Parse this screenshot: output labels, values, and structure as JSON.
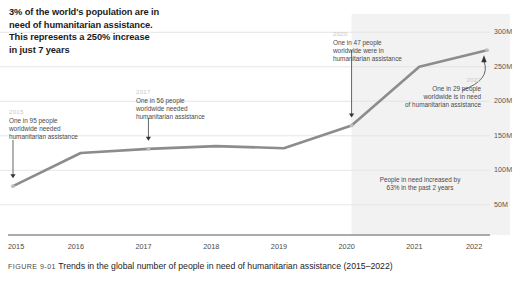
{
  "headline": {
    "lines": [
      "3% of the world's population are in",
      "need of humanitarian assistance.",
      "This represents a 250% increase",
      "in just 7 years"
    ]
  },
  "annotations": [
    {
      "key": "a2015",
      "year": "2015",
      "lines": [
        "One in 95 people",
        "worldwide needed",
        "humanitarian assistance"
      ]
    },
    {
      "key": "a2017",
      "year": "2017",
      "lines": [
        "One in 56 people",
        "worldwide needed",
        "humanitarian assistance"
      ]
    },
    {
      "key": "a2020",
      "year": "2020",
      "lines": [
        "One in 47 people",
        "worldwide were in",
        "humanitarian assistance"
      ]
    },
    {
      "key": "a2022",
      "year": "2022",
      "lines": [
        "One in 29 people",
        "worldwide is in need",
        "of humanitarian assistance"
      ]
    }
  ],
  "callout": {
    "lines": [
      "People in need increased by",
      "63% in the past 2 years"
    ]
  },
  "caption": {
    "number": "FIGURE 9-01",
    "text": "Trends in the global number of people in need of humanitarian assistance (2015–2022)"
  },
  "colors": {
    "line": "#8c8c8c",
    "grid": "#e3e3e3",
    "axis": "#8f8f8f",
    "shade": "#f2f2f2",
    "year_label": "#c9c9c9",
    "text": "#3a3a3a"
  },
  "chart_data": {
    "type": "line",
    "title": "Trends in the global number of people in need of humanitarian assistance (2015–2022)",
    "xlabel": "",
    "ylabel": "",
    "categories": [
      "2015",
      "2016",
      "2017",
      "2018",
      "2019",
      "2020",
      "2021",
      "2022"
    ],
    "x": [
      2015,
      2016,
      2017,
      2018,
      2019,
      2020,
      2021,
      2022
    ],
    "values": [
      77000000,
      125000000,
      131000000,
      135000000,
      132000000,
      165000000,
      250000000,
      274000000
    ],
    "value_labels": [
      "77M",
      "125M",
      "131M",
      "135M",
      "132M",
      "165M",
      "250M",
      "274M"
    ],
    "ylim": [
      25000000,
      312000000
    ],
    "yticks": [
      50000000,
      100000000,
      150000000,
      200000000,
      250000000,
      300000000
    ],
    "ytick_labels": [
      "50M",
      "100M",
      "150M",
      "200M",
      "250M",
      "300M"
    ],
    "xtick_labels": [
      "2015",
      "2016",
      "2017",
      "2018",
      "2019",
      "2020",
      "2021",
      "2022"
    ],
    "grid": true,
    "legend": "none",
    "series": [
      {
        "name": "People in need of humanitarian assistance",
        "values": [
          77000000,
          125000000,
          131000000,
          135000000,
          132000000,
          165000000,
          250000000,
          274000000
        ]
      }
    ],
    "shaded_region": {
      "from": "2020",
      "to": "2022",
      "label": ""
    },
    "markers": [
      {
        "year": "2015",
        "ratio": "One in 95 people"
      },
      {
        "year": "2017",
        "ratio": "One in 56 people"
      },
      {
        "year": "2020",
        "ratio": "One in 47 people"
      },
      {
        "year": "2022",
        "ratio": "One in 29 people"
      }
    ]
  }
}
